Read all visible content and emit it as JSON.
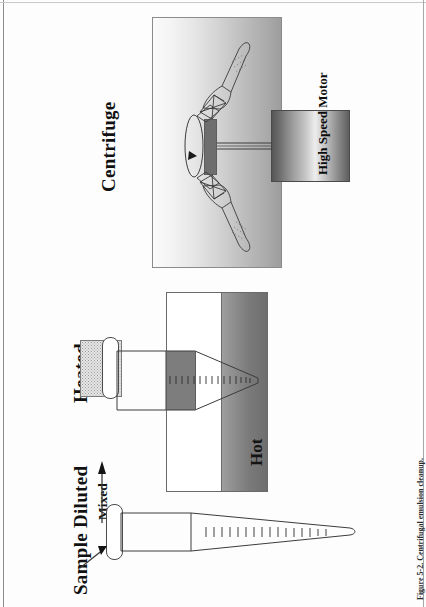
{
  "figure": {
    "caption": "Figure 5-2. Centrifugal emulsion cleanup.",
    "orientation": "rotated-90-ccw",
    "width": 426,
    "height": 607
  },
  "panels": [
    {
      "id": "panel-sample-diluted",
      "title": "Sample Diluted",
      "sub_label": "Mixed",
      "arrow": "mixed-flow-arrow",
      "parts": [
        {
          "name": "centrifuge-tube",
          "fill": "white"
        },
        {
          "name": "tube-cap",
          "fill": "white"
        },
        {
          "name": "graduation-ticks",
          "count": 16
        },
        {
          "name": "inlet-arrow"
        }
      ]
    },
    {
      "id": "panel-heated",
      "title": "Heated",
      "inner_label": "Hot",
      "parts": [
        {
          "name": "heater-block",
          "fill": "dotted-gray"
        },
        {
          "name": "tube-cap",
          "fill": "white"
        },
        {
          "name": "centrifuge-tube",
          "fill": "white"
        },
        {
          "name": "hot-zone-gradient",
          "fill": "gray-gradient"
        },
        {
          "name": "dark-band",
          "fill": "#7d7d7d"
        },
        {
          "name": "graduation-ticks",
          "count": 16
        }
      ]
    },
    {
      "id": "panel-centrifuge",
      "title": "Centrifuge",
      "motor_label": "High Speed Motor",
      "parts": [
        {
          "name": "centrifuge-chamber",
          "fill": "gray-gradient"
        },
        {
          "name": "high-speed-motor",
          "fill": "metallic-gradient"
        },
        {
          "name": "drive-shaft"
        },
        {
          "name": "rotor-hub",
          "fill": "#6e6e6e"
        },
        {
          "name": "swinging-bucket-tube-upper"
        },
        {
          "name": "swinging-bucket-tube-lower"
        },
        {
          "name": "rotation-arrow"
        }
      ]
    }
  ],
  "colors": {
    "ink": "#111111",
    "outline": "#4b4b4b",
    "dark_band": "#7d7d7d",
    "page": "#fdfdfd"
  }
}
